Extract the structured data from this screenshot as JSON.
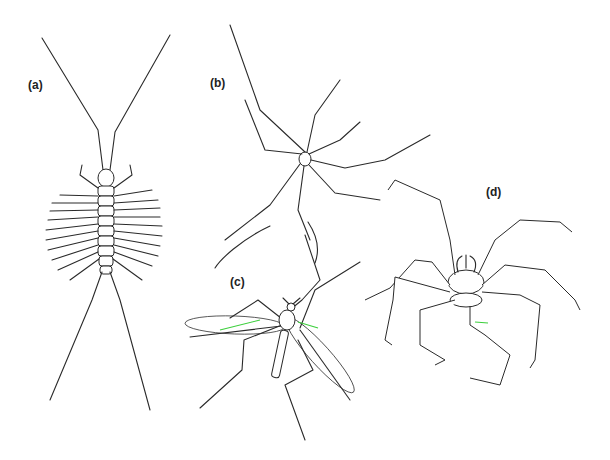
{
  "figure": {
    "panels": [
      {
        "id": "a",
        "label": "(a)",
        "subject": "centipede (dorsal view, long antennae, many legs)"
      },
      {
        "id": "b",
        "label": "(b)",
        "subject": "harvestman / daddy-long-legs with very long thin legs"
      },
      {
        "id": "c",
        "label": "(c)",
        "subject": "crane fly with two wings and long jointed legs"
      },
      {
        "id": "d",
        "label": "(d)",
        "subject": "segmented-leg arachnid (sea-spider-like) with eight legs"
      }
    ],
    "colors": {
      "background": "#ffffff",
      "ink": "#2a2a2a",
      "highlight": "#3ccf3c"
    }
  }
}
